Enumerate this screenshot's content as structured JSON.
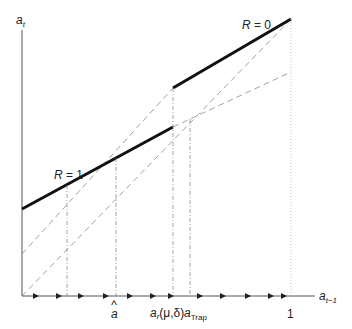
{
  "diagram": {
    "y_axis_label": "a",
    "y_axis_sub": "t",
    "x_axis_label": "a",
    "x_axis_sub": "t−1",
    "line_labels": {
      "r1": "R = 1",
      "r0": "R = 0"
    },
    "tick_labels": {
      "a_hat": "a",
      "a_hat_accent": "^",
      "a_r": "a",
      "a_r_sub": "r",
      "a_r_args": "(μ,δ)",
      "a_trap": "a",
      "a_trap_sub": "Trap",
      "one": "1"
    },
    "colors": {
      "axis": "#555555",
      "thick_line": "#111111",
      "dashed": "#888888",
      "dotted": "#999999"
    }
  }
}
